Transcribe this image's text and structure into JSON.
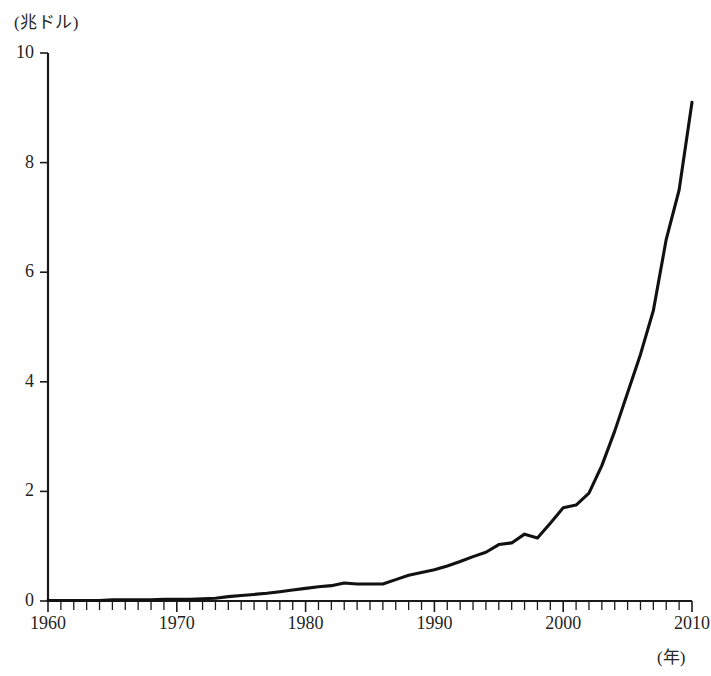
{
  "chart_data": {
    "type": "line",
    "title": "",
    "subtitle": "",
    "xlabel": "(年)",
    "ylabel": "(兆ドル)",
    "xlim": [
      1960,
      2010
    ],
    "ylim": [
      0,
      10
    ],
    "grid": false,
    "legend": null,
    "y_ticks": [
      0,
      2,
      4,
      6,
      8,
      10
    ],
    "y_tick_labels": [
      "0",
      "2",
      "4",
      "6",
      "8",
      "10"
    ],
    "x_ticks": [
      1960,
      1970,
      1980,
      1990,
      2000,
      2010
    ],
    "x_tick_labels": [
      "1960",
      "1970",
      "1980",
      "1990",
      "2000",
      "2010"
    ],
    "x_minor_tick_step": 1,
    "series": [
      {
        "name": "",
        "color": "#111111",
        "x": [
          1960,
          1961,
          1962,
          1963,
          1964,
          1965,
          1966,
          1967,
          1968,
          1969,
          1970,
          1971,
          1972,
          1973,
          1974,
          1975,
          1976,
          1977,
          1978,
          1979,
          1980,
          1981,
          1982,
          1983,
          1984,
          1985,
          1986,
          1987,
          1988,
          1989,
          1990,
          1991,
          1992,
          1993,
          1994,
          1995,
          1996,
          1997,
          1998,
          1999,
          2000,
          2001,
          2002,
          2003,
          2004,
          2005,
          2006,
          2007,
          2008,
          2009,
          2010
        ],
        "y": [
          0.01,
          0.01,
          0.01,
          0.01,
          0.01,
          0.02,
          0.02,
          0.02,
          0.02,
          0.03,
          0.03,
          0.03,
          0.04,
          0.05,
          0.08,
          0.1,
          0.12,
          0.14,
          0.17,
          0.2,
          0.23,
          0.26,
          0.28,
          0.33,
          0.31,
          0.31,
          0.31,
          0.39,
          0.47,
          0.52,
          0.57,
          0.64,
          0.72,
          0.81,
          0.89,
          1.03,
          1.06,
          1.22,
          1.15,
          1.42,
          1.7,
          1.75,
          1.97,
          2.47,
          3.1,
          3.8,
          4.5,
          5.3,
          6.6,
          7.5,
          9.1
        ]
      }
    ]
  },
  "axis": {
    "y_unit": "(兆ドル)",
    "x_unit": "(年)"
  }
}
